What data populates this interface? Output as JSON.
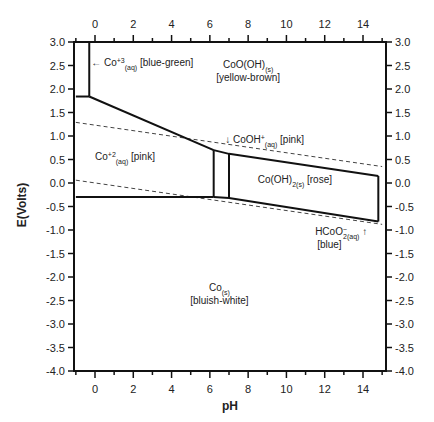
{
  "chart_data": {
    "type": "diagram",
    "title": "",
    "xlabel": "pH",
    "ylabel": "E(Volts)",
    "xlim": [
      -1,
      15
    ],
    "ylim": [
      -4.0,
      3.0
    ],
    "x_ticks": [
      0,
      2,
      4,
      6,
      8,
      10,
      12,
      14
    ],
    "y_ticks": [
      "3.0",
      "2.5",
      "2.0",
      "1.5",
      "1.0",
      "0.5",
      "0.0",
      "-0.5",
      "-1.0",
      "-1.5",
      "-2.0",
      "-2.5",
      "-3.0",
      "-3.5",
      "-4.0"
    ],
    "boundaries_solid": [
      {
        "name": "Co3+/Co2+ horizontal",
        "points": [
          [
            -1,
            1.84
          ],
          [
            -0.3,
            1.84
          ]
        ]
      },
      {
        "name": "Co3+ vertical",
        "points": [
          [
            -0.3,
            3.0
          ],
          [
            -0.3,
            1.84
          ]
        ]
      },
      {
        "name": "CoO(OH)/Co2+ sloped",
        "points": [
          [
            -0.3,
            1.84
          ],
          [
            6.2,
            0.7
          ]
        ]
      },
      {
        "name": "CoO(OH)/CoOH+",
        "points": [
          [
            6.2,
            0.7
          ],
          [
            7.0,
            0.62
          ]
        ]
      },
      {
        "name": "CoO(OH)/Co(OH)2",
        "points": [
          [
            7.0,
            0.62
          ],
          [
            14.8,
            0.15
          ]
        ]
      },
      {
        "name": "Co2+/Co",
        "points": [
          [
            -1,
            -0.3
          ],
          [
            6.2,
            -0.3
          ]
        ]
      },
      {
        "name": "CoOH+/Co",
        "points": [
          [
            6.2,
            -0.3
          ],
          [
            7.0,
            -0.32
          ]
        ]
      },
      {
        "name": "Co(OH)2/Co",
        "points": [
          [
            7.0,
            -0.32
          ],
          [
            14.8,
            -0.82
          ]
        ]
      },
      {
        "name": "Co2+/CoOH+ vertical",
        "points": [
          [
            6.2,
            0.7
          ],
          [
            6.2,
            -0.3
          ]
        ]
      },
      {
        "name": "CoOH+/Co(OH)2 vertical",
        "points": [
          [
            7.0,
            0.62
          ],
          [
            7.0,
            -0.32
          ]
        ]
      },
      {
        "name": "Co(OH)2/HCoO2- vertical",
        "points": [
          [
            14.8,
            0.15
          ],
          [
            14.8,
            -0.82
          ]
        ]
      }
    ],
    "boundaries_dashed": [
      {
        "name": "O2/H2O",
        "points": [
          [
            -1,
            1.29
          ],
          [
            15,
            0.35
          ]
        ]
      },
      {
        "name": "H2O/H2",
        "points": [
          [
            -1,
            0.06
          ],
          [
            15,
            -0.88
          ]
        ]
      }
    ],
    "annotations": [
      {
        "label": "← Co+3(aq) [blue-green]",
        "main": "← Co",
        "sup": "+3",
        "sub": "(aq)",
        "tail": " [blue-green]",
        "x": -0.2,
        "y": 2.5
      },
      {
        "label": "CoO(OH)(s) [yellow-brown]",
        "main": "CoO(OH)",
        "sub": "(s)",
        "line2": "[yellow-brown]",
        "x": 8.0,
        "y": 2.45
      },
      {
        "label": "↓ CoOH+(aq) [pink]",
        "main": "↓ CoOH",
        "sup": "+",
        "sub": "(aq)",
        "tail": " [pink]",
        "x": 6.8,
        "y": 0.85
      },
      {
        "label": "Co+2(aq) [pink]",
        "main": "Co",
        "sup": "+2",
        "sub": "(aq)",
        "tail": " [pink]",
        "x": 0.0,
        "y": 0.5
      },
      {
        "label": "Co(OH)2(s) [rose]",
        "main": "Co(OH)",
        "sub": "2(s)",
        "tail": " [rose]",
        "x": 8.5,
        "y": 0.0
      },
      {
        "label": "HCoO2-(aq) ↑ [blue]",
        "main": "HCoO",
        "sub": "2",
        "sup": "−",
        "sub2": "(aq)",
        "tail": " ↑",
        "line2": "[blue]",
        "x": 11.5,
        "y": -1.1
      },
      {
        "label": "Co(s) [bluish-white]",
        "main": "Co",
        "sub": "(s)",
        "line2": "[bluish-white]",
        "x": 6.5,
        "y": -2.3
      }
    ],
    "grid": false,
    "legend": "none"
  }
}
